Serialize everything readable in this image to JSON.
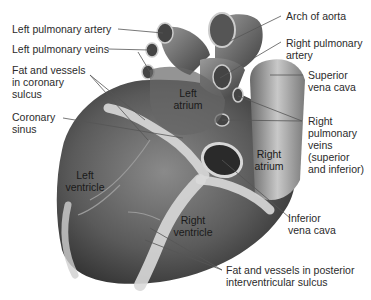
{
  "figure": {
    "external_labels": {
      "left_pulmonary_artery": "Left pulmonary artery",
      "left_pulmonary_veins": "Left pulmonary veins",
      "fat_vessels_coronary": "Fat and vessels\nin coronary\nsulcus",
      "coronary_sinus": "Coronary\nsinus",
      "arch_of_aorta": "Arch of aorta",
      "right_pulmonary_artery": "Right pulmonary\nartery",
      "superior_vena_cava": "Superior\nvena cava",
      "right_pulmonary_veins": "Right\npulmonary\nveins\n(superior\nand inferior)",
      "inferior_vena_cava": "Inferior\nvena cava",
      "fat_vessels_posterior": "Fat and vessels in posterior\ninterventricular sulcus"
    },
    "internal_labels": {
      "left_atrium": "Left\natrium",
      "right_atrium": "Right\natrium",
      "left_ventricle": "Left\nventricle",
      "right_ventricle": "Right\nventricle"
    },
    "colors": {
      "heart_dark": "#4a4a4a",
      "heart_mid": "#7a7a7a",
      "heart_light": "#b8b8b8",
      "fat": "#d9d9d9",
      "leader_line": "#555555"
    }
  }
}
